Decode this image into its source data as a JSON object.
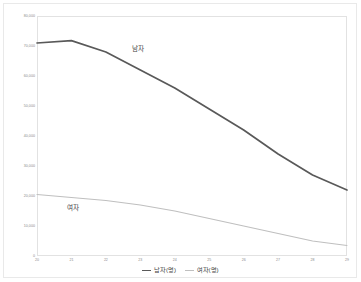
{
  "chart_data": {
    "type": "line",
    "title": "",
    "subtitle": "",
    "xlabel": "",
    "ylabel": "",
    "x": [
      "20",
      "21",
      "22",
      "23",
      "24",
      "25",
      "26",
      "27",
      "28",
      "29"
    ],
    "categories": [
      "20",
      "21",
      "22",
      "23",
      "24",
      "25",
      "26",
      "27",
      "28",
      "29"
    ],
    "series": [
      {
        "name": "남자(명)",
        "short_name": "남자",
        "color": "#595959",
        "values": [
          71000,
          71800,
          68000,
          62000,
          56000,
          49000,
          42000,
          34000,
          27000,
          22000
        ]
      },
      {
        "name": "여자(명)",
        "short_name": "여자",
        "color": "#bfbfbf",
        "values": [
          20500,
          19500,
          18500,
          17000,
          15000,
          12500,
          10000,
          7500,
          5000,
          3500
        ]
      }
    ],
    "ylim": [
      0,
      80000
    ],
    "yticks": [
      0,
      10000,
      20000,
      30000,
      40000,
      50000,
      60000,
      70000,
      80000
    ],
    "ytick_labels": [
      "0",
      "10,000",
      "20,000",
      "30,000",
      "40,000",
      "50,000",
      "60,000",
      "70,000",
      "80,000"
    ],
    "xtick_labels": [
      "20",
      "21",
      "22",
      "23",
      "24",
      "25",
      "26",
      "27",
      "28",
      "29"
    ],
    "grid": false,
    "legend_position": "bottom",
    "annotations": [
      {
        "name": "남자",
        "text": "남자"
      },
      {
        "name": "여자",
        "text": "여자"
      }
    ]
  },
  "labels": {
    "male_inline": "남자",
    "female_inline": "여자"
  },
  "legend": {
    "items": [
      {
        "label": "남자(명)",
        "color": "#595959"
      },
      {
        "label": "여자(명)",
        "color": "#bfbfbf"
      }
    ]
  }
}
